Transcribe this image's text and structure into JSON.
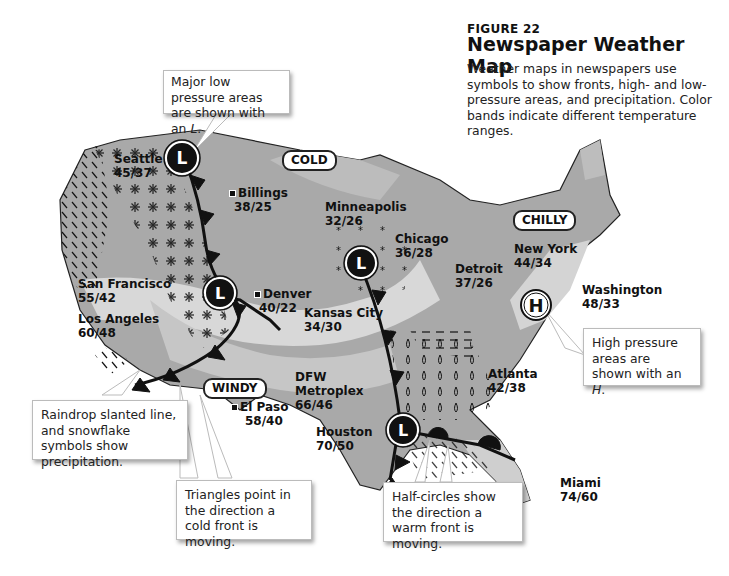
{
  "figure": {
    "label": "FIGURE 22",
    "title": "Newspaper Weather Map",
    "description": "Weather maps in newspapers use symbols to show fronts, high- and low-pressure areas, and precipitation. Color bands indicate different temperature ranges."
  },
  "regions": {
    "cold": "COLD",
    "chilly": "CHILLY",
    "windy": "WINDY"
  },
  "cities": [
    {
      "name": "Seattle",
      "temps": "45/37"
    },
    {
      "name": "Billings",
      "temps": "38/25"
    },
    {
      "name": "Minneapolis",
      "temps": "32/26"
    },
    {
      "name": "Chicago",
      "temps": "36/28"
    },
    {
      "name": "Detroit",
      "temps": "37/26"
    },
    {
      "name": "New York",
      "temps": "44/34"
    },
    {
      "name": "Washington",
      "temps": "48/33"
    },
    {
      "name": "San Francisco",
      "temps": "55/42"
    },
    {
      "name": "Los Angeles",
      "temps": "60/48"
    },
    {
      "name": "Denver",
      "temps": "40/22"
    },
    {
      "name": "Kansas City",
      "temps": "34/30"
    },
    {
      "name": "Atlanta",
      "temps": "42/38"
    },
    {
      "name": "DFW",
      "name2": "Metroplex",
      "temps": "66/46"
    },
    {
      "name": "El Paso",
      "temps": "58/40"
    },
    {
      "name": "Houston",
      "temps": "70/50"
    },
    {
      "name": "Miami",
      "temps": "74/60"
    }
  ],
  "pressure_symbols": {
    "low": "L",
    "high": "H"
  },
  "callouts": {
    "low_pressure": {
      "text": "Major low pressure areas are shown with an ",
      "em": "L",
      "end": "."
    },
    "high_pressure": {
      "text": "High pressure areas are shown with an ",
      "em": "H",
      "end": "."
    },
    "precipitation": "Raindrop slanted line, and snowflake symbols show precipitation.",
    "cold_front": "Triangles point in the direction a cold front is moving.",
    "warm_front": "Half-circles show the direction a warm front is moving."
  }
}
